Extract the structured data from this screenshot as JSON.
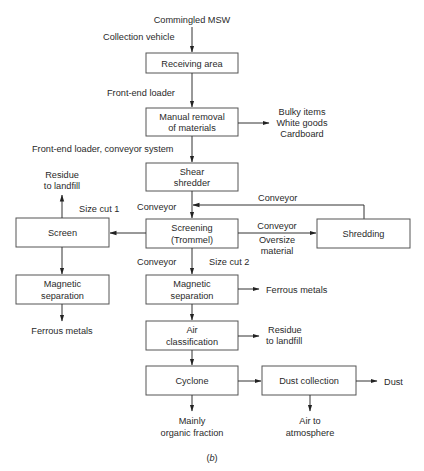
{
  "diagram": {
    "input": "Commingled MSW",
    "caption": "(b)",
    "caption_letter": "b",
    "boxes": {
      "receiving": [
        "Receiving area"
      ],
      "manual_removal": [
        "Manual removal",
        "of materials"
      ],
      "shear_shredder": [
        "Shear",
        "shredder"
      ],
      "screening": [
        "Screening",
        "(Trommel)"
      ],
      "screen": [
        "Screen"
      ],
      "shredding": [
        "Shredding"
      ],
      "magnetic_left": [
        "Magnetic",
        "separation"
      ],
      "magnetic_main": [
        "Magnetic",
        "separation"
      ],
      "air_classification": [
        "Air",
        "classification"
      ],
      "cyclone": [
        "Cyclone"
      ],
      "dust_collection": [
        "Dust collection"
      ]
    },
    "labels": {
      "collection_vehicle": "Collection vehicle",
      "front_end_loader": "Front-end loader",
      "front_end_loader_conveyor": "Front-end loader, conveyor system",
      "conveyor_feedback": "Conveyor",
      "conveyor_to_screening": "Conveyor",
      "conveyor_to_shredding": "Conveyor",
      "oversize_material": [
        "Oversize",
        "material"
      ],
      "size_cut_1": "Size cut 1",
      "size_cut_2": "Size cut 2",
      "conveyor_to_magnetic": "Conveyor"
    },
    "outputs": {
      "manual_removal": [
        "Bulky items",
        "White goods",
        "Cardboard"
      ],
      "screen_residue": [
        "Residue",
        "to landfill"
      ],
      "ferrous_left": "Ferrous metals",
      "ferrous_main": "Ferrous metals",
      "air_residue": [
        "Residue",
        "to landfill"
      ],
      "cyclone": [
        "Mainly",
        "organic fraction"
      ],
      "dust_collection_air": [
        "Air to",
        "atmosphere"
      ],
      "dust": "Dust"
    }
  }
}
